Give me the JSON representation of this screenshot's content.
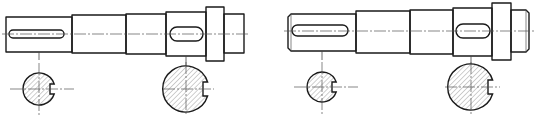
{
  "figure": {
    "title": "",
    "line_color": "#1a1a1a",
    "hatch_color": "#777777",
    "background": "#ffffff"
  },
  "views": [
    {
      "id": "left-shaft",
      "segments": 5,
      "keyways": 2,
      "sections": [
        {
          "id": "left-section-small",
          "keyway_side": "right"
        },
        {
          "id": "left-section-large",
          "keyway_side": "right"
        }
      ],
      "end_chamfer": false
    },
    {
      "id": "right-shaft",
      "segments": 5,
      "keyways": 2,
      "sections": [
        {
          "id": "right-section-small",
          "keyway_side": "right"
        },
        {
          "id": "right-section-large",
          "keyway_side": "right"
        }
      ],
      "end_chamfer": true
    }
  ]
}
